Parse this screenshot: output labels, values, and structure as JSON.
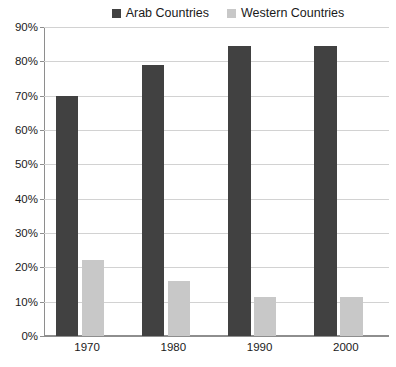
{
  "chart_data": {
    "type": "bar",
    "title": "",
    "subtitle": "",
    "xlabel": "",
    "ylabel": "",
    "categories": [
      "1970",
      "1980",
      "1990",
      "2000"
    ],
    "series": [
      {
        "name": "Arab Countries",
        "color": "#414141",
        "values": [
          70,
          79,
          84.5,
          84.5
        ]
      },
      {
        "name": "Western Countries",
        "color": "#c8c8c8",
        "values": [
          22,
          16,
          11.5,
          11.5
        ]
      }
    ],
    "ylim": [
      0,
      90
    ],
    "ytick_step": 10,
    "ytick_labels": [
      "0%",
      "10%",
      "20%",
      "30%",
      "40%",
      "50%",
      "60%",
      "70%",
      "80%",
      "90%"
    ],
    "grid": true,
    "legend_position": "top-right",
    "value_suffix": "%"
  },
  "legend": {
    "entries": [
      {
        "label": "Arab Countries",
        "color": "#414141",
        "swatch_icon": "legend-swatch-icon"
      },
      {
        "label": "Western Countries",
        "color": "#c8c8c8",
        "swatch_icon": "legend-swatch-icon"
      }
    ]
  },
  "axes": {
    "y": {
      "labels": [
        "90%",
        "80%",
        "70%",
        "60%",
        "50%",
        "40%",
        "30%",
        "20%",
        "10%",
        "0%"
      ]
    },
    "x": {
      "labels": [
        "1970",
        "1980",
        "1990",
        "2000"
      ]
    }
  },
  "colors": {
    "series_dark": "#414141",
    "series_light": "#c8c8c8",
    "gridline": "#d2d2d2",
    "axis": "#8e8e8e",
    "text": "#1a1a1a",
    "background": "#ffffff"
  }
}
